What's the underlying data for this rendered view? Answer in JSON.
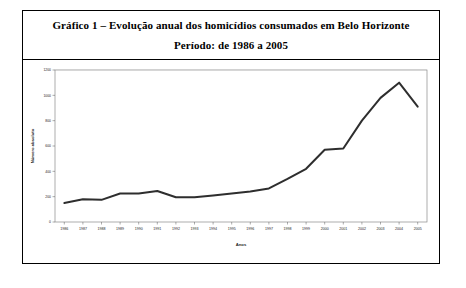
{
  "figure": {
    "title_line1": "Gráfico 1 – Evolução anual dos homicídios consumados em Belo Horizonte",
    "title_line2": "Período: de 1986 a 2005"
  },
  "colors": {
    "line": "#2e2e2e",
    "frame": "#8a8a8a",
    "grid": "#e3e3e3",
    "text": "#1a1a1a",
    "page_border": "#000000",
    "background": "#ffffff"
  },
  "chart_data": {
    "type": "line",
    "title": "Gráfico 1 – Evolução anual dos homicídios consumados em Belo Horizonte",
    "subtitle": "Período: de 1986 a 2005",
    "xlabel": "Anos",
    "ylabel": "Número absoluto",
    "categories": [
      "1986",
      "1987",
      "1988",
      "1989",
      "1990",
      "1991",
      "1992",
      "1993",
      "1994",
      "1995",
      "1996",
      "1997",
      "1998",
      "1999",
      "2000",
      "2001",
      "2002",
      "2003",
      "2004",
      "2005"
    ],
    "values": [
      150,
      180,
      175,
      225,
      225,
      245,
      195,
      195,
      210,
      225,
      240,
      265,
      340,
      420,
      570,
      580,
      800,
      980,
      1100,
      910
    ],
    "series": [
      {
        "name": "Homicídios consumados",
        "values": [
          150,
          180,
          175,
          225,
          225,
          245,
          195,
          195,
          210,
          225,
          240,
          265,
          340,
          420,
          570,
          580,
          800,
          980,
          1100,
          910
        ]
      }
    ],
    "yticks": [
      0,
      200,
      400,
      600,
      800,
      1000,
      1200
    ],
    "ytick_labels": [
      "0",
      "200",
      "400",
      "600",
      "800",
      "1000",
      "1200"
    ],
    "ylim": [
      0,
      1200
    ],
    "grid": true,
    "legend": false,
    "legend_position": "none",
    "markers": false
  }
}
